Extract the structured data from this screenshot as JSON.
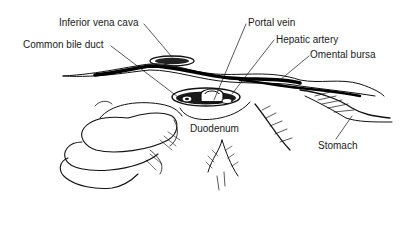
{
  "figure": {
    "type": "anatomical line illustration",
    "colors": {
      "ink": "#111111",
      "background": "#ffffff"
    },
    "labels": [
      {
        "id": "inferior-vena-cava",
        "text": "Inferior vena cava",
        "x": 59,
        "y": 17,
        "leader": [
          [
            144,
            24
          ],
          [
            172,
            57
          ]
        ]
      },
      {
        "id": "common-bile-duct",
        "text": "Common bile duct",
        "x": 23,
        "y": 39,
        "leader": [
          [
            111,
            46
          ],
          [
            178,
            97
          ]
        ]
      },
      {
        "id": "portal-vein",
        "text": "Portal vein",
        "x": 248,
        "y": 17,
        "leader": [
          [
            246,
            24
          ],
          [
            214,
            100
          ]
        ]
      },
      {
        "id": "hepatic-artery",
        "text": "Hepatic artery",
        "x": 276,
        "y": 34,
        "leader": [
          [
            274,
            40
          ],
          [
            232,
            94
          ]
        ]
      },
      {
        "id": "omental-bursa",
        "text": "Omental bursa",
        "x": 310,
        "y": 49,
        "leader": [
          [
            309,
            56
          ],
          [
            280,
            80
          ]
        ]
      },
      {
        "id": "duodenum",
        "text": "Duodenum",
        "x": 190,
        "y": 123,
        "leader": []
      },
      {
        "id": "stomach",
        "text": "Stomach",
        "x": 318,
        "y": 140,
        "leader": [
          [
            336,
            139
          ],
          [
            352,
            116
          ]
        ]
      }
    ]
  }
}
